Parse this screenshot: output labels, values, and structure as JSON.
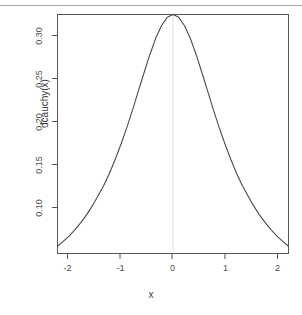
{
  "figure": {
    "background_color": "#ffffff",
    "frame_color": "#555555",
    "curve_color": "#4a4a4a",
    "reference_line_color": "#e2e2e2",
    "top_rule_color": "#a8a8a8"
  },
  "chart_data": {
    "type": "line",
    "title": "",
    "subtitle": "",
    "xlabel": "x",
    "ylabel": "dcauchy(x)",
    "xlim": [
      -2.0,
      2.0
    ],
    "ylim": [
      0.0557,
      0.3183
    ],
    "xticks": [
      -2,
      -1,
      0,
      1,
      2
    ],
    "xticklabels": [
      "-2",
      "-1",
      "0",
      "1",
      "2"
    ],
    "yticks": [
      0.1,
      0.15,
      0.2,
      0.25,
      0.3
    ],
    "yticklabels": [
      "0.10",
      "0.15",
      "0.20",
      "0.25",
      "0.30"
    ],
    "grid": false,
    "legend": null,
    "annotations": [
      {
        "name": "zero-reference-line",
        "x": 0,
        "kind": "vertical-line"
      }
    ],
    "series": [
      {
        "name": "dcauchy(x)",
        "color": "#4a4a4a",
        "x": [
          -2.0,
          -1.9,
          -1.8,
          -1.7,
          -1.6,
          -1.5,
          -1.4,
          -1.3,
          -1.2,
          -1.1,
          -1.0,
          -0.9,
          -0.8,
          -0.7,
          -0.6,
          -0.5,
          -0.4,
          -0.3,
          -0.2,
          -0.1,
          0.0,
          0.1,
          0.2,
          0.3,
          0.4,
          0.5,
          0.6,
          0.7,
          0.8,
          0.9,
          1.0,
          1.1,
          1.2,
          1.3,
          1.4,
          1.5,
          1.6,
          1.7,
          1.8,
          1.9,
          2.0
        ],
        "y": [
          0.0637,
          0.069,
          0.0749,
          0.0816,
          0.0893,
          0.0979,
          0.1077,
          0.1188,
          0.1304,
          0.1439,
          0.1592,
          0.176,
          0.194,
          0.2135,
          0.2341,
          0.2546,
          0.2744,
          0.2921,
          0.306,
          0.3152,
          0.3183,
          0.3152,
          0.306,
          0.2921,
          0.2744,
          0.2546,
          0.2341,
          0.2135,
          0.194,
          0.176,
          0.1592,
          0.1439,
          0.1304,
          0.1188,
          0.1077,
          0.0979,
          0.0893,
          0.0816,
          0.0749,
          0.069,
          0.0637
        ],
        "peak_x": 0,
        "peak_y": 0.3183
      }
    ]
  }
}
